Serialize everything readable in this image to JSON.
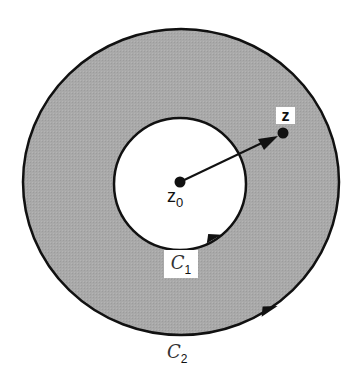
{
  "diagram": {
    "type": "annulus",
    "colors": {
      "annulus_fill": "#a9a9a9",
      "stroke": "#111111",
      "inner_fill": "#ffffff",
      "background": "#ffffff"
    },
    "outer_contour": {
      "cx": 181,
      "cy": 182,
      "rx": 158,
      "ry": 153,
      "label_main": "C",
      "label_sub": "2"
    },
    "inner_contour": {
      "cx": 180,
      "cy": 184,
      "r": 66,
      "label_main": "C",
      "label_sub": "1"
    },
    "points": {
      "z0": {
        "x": 180,
        "y": 182,
        "label_main": "z",
        "label_sub": "0"
      },
      "z": {
        "x": 283,
        "y": 133,
        "label": "z"
      }
    },
    "arrow": {
      "from": "z0",
      "to": "z"
    }
  }
}
